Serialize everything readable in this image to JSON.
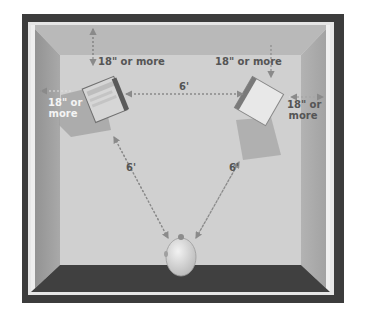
{
  "diagram": {
    "type": "speaker-placement-room",
    "labels": {
      "top_left_wall_gap": "18\" or more",
      "top_right_wall_gap": "18\" or more",
      "left_side_gap_line1": "18\" or",
      "left_side_gap_line2": "more",
      "right_side_gap_line1": "18\" or",
      "right_side_gap_line2": "more",
      "speaker_to_speaker": "6'",
      "left_speaker_to_listener": "6'",
      "right_speaker_to_listener": "6'"
    },
    "elements": [
      "left-speaker",
      "right-speaker",
      "listener-head"
    ],
    "colors": {
      "frame": "#3c3c3c",
      "back_wall": "#b8b8b8",
      "floor": "#cfcfcf",
      "text": "#555555",
      "arrow": "#8a8a8a"
    }
  }
}
